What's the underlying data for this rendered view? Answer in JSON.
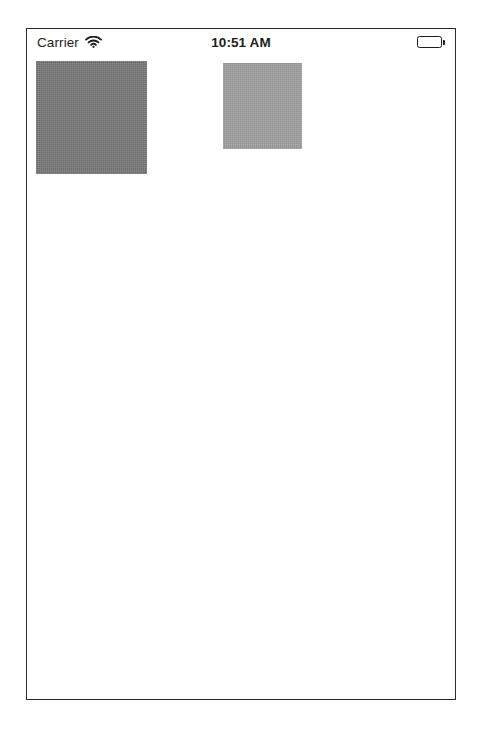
{
  "status_bar": {
    "carrier_label": "Carrier",
    "wifi_icon": "wifi-icon",
    "time": "10:51 AM",
    "battery_icon": "battery-full-icon",
    "battery_level_percent": 100
  },
  "content": {
    "boxes": [
      {
        "name": "primary-gray-box",
        "color": "#878787",
        "x": 9,
        "y": 6,
        "width": 111,
        "height": 113
      },
      {
        "name": "secondary-gray-box",
        "color": "#ababab",
        "x": 196,
        "y": 8,
        "width": 79,
        "height": 86
      }
    ]
  },
  "device": {
    "frame_color": "#2b2b2b",
    "screen_background": "#ffffff"
  }
}
